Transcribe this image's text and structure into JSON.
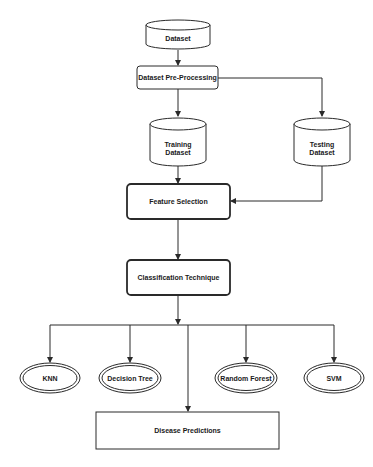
{
  "diagram": {
    "type": "flowchart",
    "title": "",
    "nodes": {
      "dataset": {
        "label": "Dataset",
        "shape": "cylinder"
      },
      "preprocessing": {
        "label": "Dataset Pre-Processing",
        "shape": "rounded-rectangle"
      },
      "training": {
        "label_line1": "Training",
        "label_line2": "Dataset",
        "shape": "cylinder"
      },
      "testing": {
        "label_line1": "Testing",
        "label_line2": "Dataset",
        "shape": "cylinder"
      },
      "feature_selection": {
        "label": "Feature Selection",
        "shape": "rounded-rectangle-bold"
      },
      "classification": {
        "label": "Classification Technique",
        "shape": "rounded-rectangle-bold"
      },
      "knn": {
        "label": "KNN",
        "shape": "double-ellipse"
      },
      "decision_tree": {
        "label": "Decision Tree",
        "shape": "double-ellipse"
      },
      "random_forest": {
        "label": "Random Forest",
        "shape": "double-ellipse"
      },
      "svm": {
        "label": "SVM",
        "shape": "double-ellipse"
      },
      "disease_predictions": {
        "label": "Disease Predictions",
        "shape": "rectangle"
      }
    },
    "edges": [
      {
        "from": "Dataset",
        "to": "Dataset Pre-Processing"
      },
      {
        "from": "Dataset Pre-Processing",
        "to": "Training Dataset"
      },
      {
        "from": "Dataset Pre-Processing",
        "to": "Testing Dataset"
      },
      {
        "from": "Training Dataset",
        "to": "Feature Selection"
      },
      {
        "from": "Testing Dataset",
        "to": "Feature Selection"
      },
      {
        "from": "Feature Selection",
        "to": "Classification Technique"
      },
      {
        "from": "Classification Technique",
        "to": "KNN"
      },
      {
        "from": "Classification Technique",
        "to": "Decision Tree"
      },
      {
        "from": "Classification Technique",
        "to": "Random Forest"
      },
      {
        "from": "Classification Technique",
        "to": "SVM"
      },
      {
        "from": "Classification Technique",
        "to": "Disease Predictions"
      }
    ],
    "colors": {
      "stroke": "#2a2a2a",
      "fill": "#ffffff",
      "text": "#1a1a1a"
    }
  }
}
